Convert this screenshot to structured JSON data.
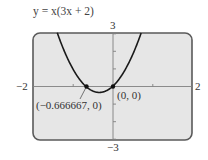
{
  "chart_data": {
    "type": "line",
    "title": "y = x(3x + 2)",
    "function": "y = x(3x + 2)",
    "xlabel": "",
    "ylabel": "",
    "xlim": [
      -2,
      2
    ],
    "ylim": [
      -3,
      3
    ],
    "x_tick_labels": [
      "-2",
      "2"
    ],
    "y_tick_labels": [
      "3",
      "-3"
    ],
    "x_ticks": [
      -2,
      -1,
      0,
      1,
      2
    ],
    "y_ticks": [
      -3,
      -2,
      -1,
      0,
      1,
      2,
      3
    ],
    "grid": false,
    "series": [
      {
        "name": "y = x(3x + 2)",
        "x": [
          -1.4,
          -1.2,
          -1.0,
          -0.8,
          -0.666667,
          -0.5,
          -0.333333,
          -0.2,
          0.0,
          0.2,
          0.4,
          0.6,
          0.73
        ],
        "y": [
          3.08,
          1.92,
          1.0,
          0.32,
          0.0,
          -0.25,
          -0.333333,
          -0.28,
          0.0,
          0.52,
          1.28,
          2.28,
          3.06
        ]
      }
    ],
    "points": [
      {
        "x": -0.666667,
        "y": 0,
        "label": "(-0.666667, 0)"
      },
      {
        "x": 0,
        "y": 0,
        "label": "(0, 0)"
      }
    ],
    "annotations": [
      "(−0.666667, 0)",
      "(0, 0)"
    ]
  },
  "labels": {
    "title_prefix": "y = ",
    "title_expr": "x(3x + 2)",
    "x_min": "−2",
    "x_max": "2",
    "y_max": "3",
    "y_min": "−3",
    "point_left": "(−0.666667, 0)",
    "point_origin": "(0, 0)"
  },
  "colors": {
    "screen_bg": "#e6e6e6",
    "border": "#5a5a5a",
    "curve": "#1a1a1a",
    "axis": "#777777"
  }
}
